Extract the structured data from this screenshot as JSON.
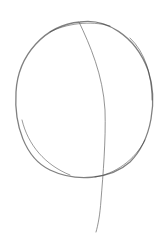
{
  "image": {
    "description": "Pencil sketch of a circle with a curved vertical line",
    "background": "#ffffff",
    "stroke_color": "#6a6a6a",
    "shapes": [
      {
        "type": "circle-outline",
        "cx": 84,
        "cy": 100,
        "rx": 69,
        "ry": 79
      },
      {
        "type": "curved-line",
        "from": [
          79,
          22
        ],
        "via": [
          104,
          110
        ],
        "to": [
          97,
          232
        ]
      }
    ]
  }
}
